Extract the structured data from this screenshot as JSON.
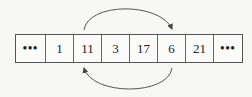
{
  "diagram": {
    "cells": [
      {
        "value": "•••",
        "kind": "ellipsis"
      },
      {
        "value": "1"
      },
      {
        "value": "11"
      },
      {
        "value": "3"
      },
      {
        "value": "17"
      },
      {
        "value": "6"
      },
      {
        "value": "21"
      },
      {
        "value": "•••",
        "kind": "ellipsis"
      }
    ],
    "arrows": [
      {
        "from": "11",
        "to": "6",
        "position": "top"
      },
      {
        "from": "6",
        "to": "11",
        "position": "bottom"
      }
    ],
    "colors": {
      "line": "#555555",
      "text": "#222222",
      "background": "#f7f7f5"
    }
  }
}
